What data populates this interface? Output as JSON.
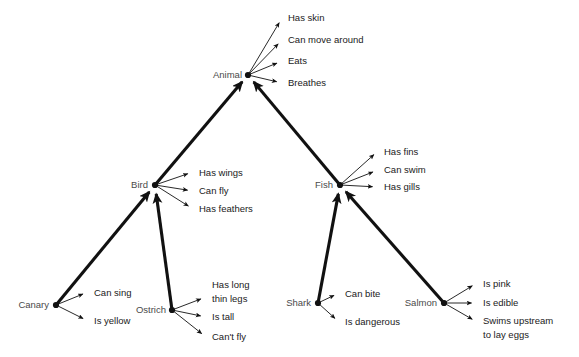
{
  "diagram": {
    "background_color": "#ffffff",
    "node_color": "#4a4a4a",
    "property_color": "#1a1a1a",
    "edge_color": "#111111",
    "nodes": [
      {
        "id": "animal",
        "label": "Animal",
        "x": 248,
        "y": 75,
        "label_x": 242,
        "label_y": 78,
        "anchor": "end"
      },
      {
        "id": "bird",
        "label": "Bird",
        "x": 155,
        "y": 185,
        "label_x": 148,
        "label_y": 188,
        "anchor": "end"
      },
      {
        "id": "fish",
        "label": "Fish",
        "x": 340,
        "y": 185,
        "label_x": 333,
        "label_y": 188,
        "anchor": "end"
      },
      {
        "id": "canary",
        "label": "Canary",
        "x": 56,
        "y": 305,
        "label_x": 49,
        "label_y": 308,
        "anchor": "end"
      },
      {
        "id": "ostrich",
        "label": "Ostrich",
        "x": 172,
        "y": 310,
        "label_x": 166,
        "label_y": 313,
        "anchor": "end"
      },
      {
        "id": "shark",
        "label": "Shark",
        "x": 318,
        "y": 303,
        "label_x": 311,
        "label_y": 306,
        "anchor": "end"
      },
      {
        "id": "salmon",
        "label": "Salmon",
        "x": 444,
        "y": 303,
        "label_x": 437,
        "label_y": 306,
        "anchor": "end"
      }
    ],
    "isa_edges": [
      {
        "id": "bird-isa-animal",
        "from": "bird",
        "to": "animal",
        "x1": 155,
        "y1": 185,
        "x2": 248,
        "y2": 75
      },
      {
        "id": "fish-isa-animal",
        "from": "fish",
        "to": "animal",
        "x1": 340,
        "y1": 185,
        "x2": 248,
        "y2": 75
      },
      {
        "id": "canary-isa-bird",
        "from": "canary",
        "to": "bird",
        "x1": 56,
        "y1": 305,
        "x2": 155,
        "y2": 185
      },
      {
        "id": "ostrich-isa-bird",
        "from": "ostrich",
        "to": "bird",
        "x1": 172,
        "y1": 310,
        "x2": 155,
        "y2": 185
      },
      {
        "id": "shark-isa-fish",
        "from": "shark",
        "to": "fish",
        "x1": 318,
        "y1": 303,
        "x2": 340,
        "y2": 185
      },
      {
        "id": "salmon-isa-fish",
        "from": "salmon",
        "to": "fish",
        "x1": 444,
        "y1": 303,
        "x2": 340,
        "y2": 185
      }
    ],
    "properties": [
      {
        "id": "animal-has-skin",
        "node": "animal",
        "text": "Has skin",
        "text_x": 288,
        "text_y": 21,
        "x1": 248,
        "y1": 75,
        "x2": 282,
        "y2": 18
      },
      {
        "id": "animal-can-move-around",
        "node": "animal",
        "text": "Can move around",
        "text_x": 288,
        "text_y": 43,
        "x1": 248,
        "y1": 75,
        "x2": 282,
        "y2": 40
      },
      {
        "id": "animal-eats",
        "node": "animal",
        "text": "Eats",
        "text_x": 288,
        "text_y": 64,
        "x1": 248,
        "y1": 75,
        "x2": 282,
        "y2": 61
      },
      {
        "id": "animal-breathes",
        "node": "animal",
        "text": "Breathes",
        "text_x": 288,
        "text_y": 86,
        "x1": 248,
        "y1": 75,
        "x2": 282,
        "y2": 83
      },
      {
        "id": "bird-has-wings",
        "node": "bird",
        "text": "Has wings",
        "text_x": 199,
        "text_y": 176,
        "x1": 155,
        "y1": 185,
        "x2": 193,
        "y2": 172
      },
      {
        "id": "bird-can-fly",
        "node": "bird",
        "text": "Can fly",
        "text_x": 199,
        "text_y": 194,
        "x1": 155,
        "y1": 185,
        "x2": 193,
        "y2": 191
      },
      {
        "id": "bird-has-feathers",
        "node": "bird",
        "text": "Has feathers",
        "text_x": 199,
        "text_y": 212,
        "x1": 155,
        "y1": 185,
        "x2": 193,
        "y2": 209
      },
      {
        "id": "fish-has-fins",
        "node": "fish",
        "text": "Has fins",
        "text_x": 384,
        "text_y": 155,
        "x1": 340,
        "y1": 185,
        "x2": 378,
        "y2": 151
      },
      {
        "id": "fish-can-swim",
        "node": "fish",
        "text": "Can swim",
        "text_x": 384,
        "text_y": 173,
        "x1": 340,
        "y1": 185,
        "x2": 378,
        "y2": 170
      },
      {
        "id": "fish-has-gills",
        "node": "fish",
        "text": "Has gills",
        "text_x": 384,
        "text_y": 190,
        "x1": 340,
        "y1": 185,
        "x2": 378,
        "y2": 187
      },
      {
        "id": "canary-can-sing",
        "node": "canary",
        "text": "Can sing",
        "text_x": 94,
        "text_y": 296,
        "x1": 56,
        "y1": 305,
        "x2": 88,
        "y2": 292
      },
      {
        "id": "canary-is-yellow",
        "node": "canary",
        "text": "Is yellow",
        "text_x": 94,
        "text_y": 324,
        "x1": 56,
        "y1": 305,
        "x2": 88,
        "y2": 321
      },
      {
        "id": "ostrich-has-long-legs",
        "node": "ostrich",
        "text": "Has long",
        "text_x": 212,
        "text_y": 288,
        "x1": 172,
        "y1": 310,
        "x2": 206,
        "y2": 297
      },
      {
        "id": "ostrich-is-tall",
        "node": "ostrich",
        "text": "Is tall",
        "text_x": 212,
        "text_y": 320,
        "x1": 172,
        "y1": 310,
        "x2": 206,
        "y2": 317
      },
      {
        "id": "ostrich-cant-fly",
        "node": "ostrich",
        "text": "Can't fly",
        "text_x": 212,
        "text_y": 340,
        "x1": 172,
        "y1": 310,
        "x2": 206,
        "y2": 337
      },
      {
        "id": "shark-can-bite",
        "node": "shark",
        "text": "Can bite",
        "text_x": 345,
        "text_y": 297,
        "x1": 318,
        "y1": 303,
        "x2": 339,
        "y2": 293
      },
      {
        "id": "shark-is-dangerous",
        "node": "shark",
        "text": "Is dangerous",
        "text_x": 345,
        "text_y": 325,
        "x1": 318,
        "y1": 303,
        "x2": 339,
        "y2": 322
      },
      {
        "id": "salmon-is-pink",
        "node": "salmon",
        "text": "Is pink",
        "text_x": 483,
        "text_y": 287,
        "x1": 444,
        "y1": 303,
        "x2": 477,
        "y2": 283
      },
      {
        "id": "salmon-is-edible",
        "node": "salmon",
        "text": "Is edible",
        "text_x": 483,
        "text_y": 306,
        "x1": 444,
        "y1": 303,
        "x2": 477,
        "y2": 303
      },
      {
        "id": "salmon-swims-upstream",
        "node": "salmon",
        "text": "Swims upstream",
        "text_x": 483,
        "text_y": 324,
        "x1": 444,
        "y1": 303,
        "x2": 477,
        "y2": 322
      }
    ],
    "continuation_lines": [
      {
        "id": "ostrich-has-long-legs-line2",
        "text": "thin legs",
        "text_x": 212,
        "text_y": 302
      },
      {
        "id": "salmon-swims-upstream-line2",
        "text": "to lay eggs",
        "text_x": 483,
        "text_y": 338
      }
    ]
  }
}
